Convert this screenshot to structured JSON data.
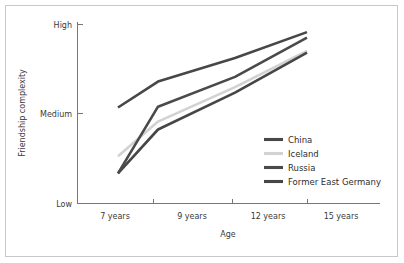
{
  "chart_data": {
    "type": "line",
    "title": "",
    "xlabel": "Age",
    "ylabel": "Friendship complexity",
    "x": [
      "7 years",
      "9 years",
      "12 years",
      "15 years"
    ],
    "categories": [
      "7 years",
      "9 years",
      "12 years",
      "15 years"
    ],
    "ytick_labels": [
      "Low",
      "Medium",
      "High"
    ],
    "ylim": [
      "Low",
      "High"
    ],
    "grid": false,
    "legend_position": "center right",
    "series": [
      {
        "name": "China",
        "color": "#474747",
        "values": [
          "Medium",
          "Medium-High",
          "High-ish",
          "High"
        ],
        "numeric_values": [
          1.0,
          1.33,
          1.63,
          1.96
        ]
      },
      {
        "name": "Iceland",
        "color": "#d2d2d2",
        "values": [
          "Low-Medium",
          "Medium-low",
          "Medium-High",
          "High-ish"
        ],
        "numeric_values": [
          0.38,
          0.82,
          1.26,
          1.72
        ]
      },
      {
        "name": "Russia",
        "color": "#4a4a4a",
        "values": [
          "Low-ish",
          "Medium",
          "Medium-High",
          "High"
        ],
        "numeric_values": [
          0.16,
          1.01,
          1.39,
          1.89
        ]
      },
      {
        "name": "Former East Germany",
        "color": "#464646",
        "values": [
          "Low-ish",
          "Medium-low",
          "Medium",
          "High-ish"
        ],
        "numeric_values": [
          0.16,
          0.72,
          1.19,
          1.7
        ]
      }
    ]
  },
  "axes": {
    "y_title": "Friendship complexity",
    "x_title": "Age",
    "y_ticks": [
      {
        "label": "High"
      },
      {
        "label": "Medium"
      },
      {
        "label": "Low"
      }
    ],
    "x_ticks": [
      {
        "label": "7 years"
      },
      {
        "label": "9 years"
      },
      {
        "label": "12 years"
      },
      {
        "label": "15 years"
      }
    ]
  },
  "legend": {
    "entries": [
      {
        "label": "China",
        "color": "#474747"
      },
      {
        "label": "Iceland",
        "color": "#d2d2d2"
      },
      {
        "label": "Russia",
        "color": "#4a4a4a"
      },
      {
        "label": "Former East Germany",
        "color": "#464646"
      }
    ]
  },
  "style": {
    "background": "#ffffff",
    "border_color": "#c8c8c8",
    "axis_color": "#777777",
    "text_color": "#3a3a3a"
  }
}
